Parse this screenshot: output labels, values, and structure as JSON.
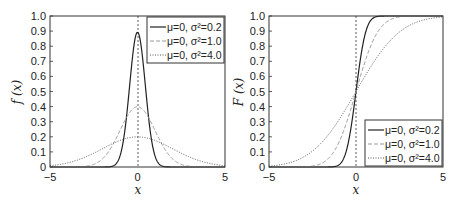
{
  "chart_data": [
    {
      "type": "line",
      "title": "",
      "xlabel": "x",
      "ylabel": "f (x)",
      "xlim": [
        -5,
        5
      ],
      "ylim": [
        0,
        1.0
      ],
      "xticks": [
        "-5",
        "0",
        "5"
      ],
      "yticks": [
        "0",
        "0.1",
        "0.2",
        "0.3",
        "0.4",
        "0.5",
        "0.6",
        "0.7",
        "0.8",
        "0.9",
        "1.0"
      ],
      "grid": false,
      "legend_position": "upper right",
      "vertical_reference_line": 0,
      "series": [
        {
          "name": "μ=0, σ²=0.2",
          "style": "solid",
          "mu": 0,
          "var": 0.2,
          "peak": 0.89
        },
        {
          "name": "μ=0, σ²=1.0",
          "style": "dashed",
          "mu": 0,
          "var": 1.0,
          "peak": 0.4
        },
        {
          "name": "μ=0, σ²=4.0",
          "style": "dotted",
          "mu": 0,
          "var": 4.0,
          "peak": 0.2
        }
      ],
      "x": [
        -5,
        -4,
        -3,
        -2,
        -1,
        0,
        1,
        2,
        3,
        4,
        5
      ],
      "series_values": {
        "μ=0, σ²=0.2": [
          0,
          0,
          0,
          0,
          0.07,
          0.89,
          0.07,
          0,
          0,
          0,
          0
        ],
        "μ=0, σ²=1.0": [
          0,
          0,
          0.004,
          0.054,
          0.242,
          0.399,
          0.242,
          0.054,
          0.004,
          0,
          0
        ],
        "μ=0, σ²=4.0": [
          0.009,
          0.027,
          0.065,
          0.121,
          0.176,
          0.199,
          0.176,
          0.121,
          0.065,
          0.027,
          0.009
        ]
      }
    },
    {
      "type": "line",
      "title": "",
      "xlabel": "x",
      "ylabel": "F (x)",
      "xlim": [
        -5,
        5
      ],
      "ylim": [
        0,
        1.0
      ],
      "xticks": [
        "-5",
        "0",
        "5"
      ],
      "yticks": [
        "0",
        "0.1",
        "0.2",
        "0.3",
        "0.4",
        "0.5",
        "0.6",
        "0.7",
        "0.8",
        "0.9",
        "1.0"
      ],
      "grid": false,
      "legend_position": "lower right",
      "vertical_reference_line": 0,
      "series": [
        {
          "name": "μ=0, σ²=0.2",
          "style": "solid",
          "mu": 0,
          "var": 0.2
        },
        {
          "name": "μ=0, σ²=1.0",
          "style": "dashed",
          "mu": 0,
          "var": 1.0
        },
        {
          "name": "μ=0, σ²=4.0",
          "style": "dotted",
          "mu": 0,
          "var": 4.0
        }
      ],
      "x": [
        -5,
        -4,
        -3,
        -2,
        -1,
        0,
        1,
        2,
        3,
        4,
        5
      ],
      "series_values": {
        "μ=0, σ²=0.2": [
          0,
          0,
          0,
          0,
          0.013,
          0.5,
          0.987,
          1,
          1,
          1,
          1
        ],
        "μ=0, σ²=1.0": [
          0,
          0,
          0.001,
          0.023,
          0.159,
          0.5,
          0.841,
          0.977,
          0.999,
          1,
          1
        ],
        "μ=0, σ²=4.0": [
          0.006,
          0.023,
          0.067,
          0.159,
          0.309,
          0.5,
          0.691,
          0.841,
          0.933,
          0.977,
          0.994
        ]
      }
    }
  ],
  "left": {
    "ylabel": "f (x)",
    "xlabel": "x",
    "legend": [
      "μ=0, σ²=0.2",
      "μ=0, σ²=1.0",
      "μ=0, σ²=4.0"
    ]
  },
  "right": {
    "ylabel": "F (x)",
    "xlabel": "x",
    "legend": [
      "μ=0, σ²=0.2",
      "μ=0, σ²=1.0",
      "μ=0, σ²=4.0"
    ]
  }
}
